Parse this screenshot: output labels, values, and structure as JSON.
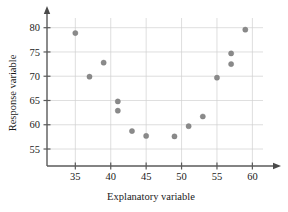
{
  "chart_data": {
    "type": "scatter",
    "title": "",
    "xlabel": "Explanatory variable",
    "ylabel": "Response variable",
    "xlim": [
      31,
      61.5
    ],
    "ylim": [
      51.5,
      82
    ],
    "xticks": [
      35,
      40,
      45,
      50,
      55,
      60
    ],
    "yticks": [
      55,
      60,
      65,
      70,
      75,
      80
    ],
    "grid": true,
    "legend": null,
    "point_color": "#8a8a8a",
    "axis_color": "#5a5a5a",
    "grid_color": "#d0d0d0",
    "points": [
      {
        "x": 35,
        "y": 78.9
      },
      {
        "x": 37,
        "y": 69.9
      },
      {
        "x": 39,
        "y": 72.8
      },
      {
        "x": 41,
        "y": 64.8
      },
      {
        "x": 41,
        "y": 62.9
      },
      {
        "x": 43,
        "y": 58.7
      },
      {
        "x": 45,
        "y": 57.7
      },
      {
        "x": 49,
        "y": 57.6
      },
      {
        "x": 51,
        "y": 59.7
      },
      {
        "x": 53,
        "y": 61.7
      },
      {
        "x": 55,
        "y": 69.7
      },
      {
        "x": 57,
        "y": 74.7
      },
      {
        "x": 57,
        "y": 72.5
      },
      {
        "x": 59,
        "y": 79.6
      }
    ]
  }
}
